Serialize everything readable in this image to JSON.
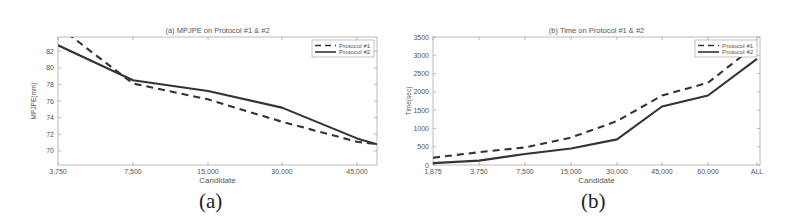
{
  "chart_data": [
    {
      "type": "line",
      "panel_caption": "(a)",
      "title": "(a) MPJPE on Protocol #1 & #2",
      "xlabel": "Candidate",
      "ylabel": "MPJPE(mm)",
      "categories": [
        "3,750",
        "7,500",
        "15,000",
        "30,000",
        "45,000"
      ],
      "x_tick_labels": [
        "3,750",
        "7,500",
        "15,000",
        "30,000",
        "45,000"
      ],
      "y_tick_labels": [
        "70",
        "72",
        "74",
        "76",
        "78",
        "80",
        "82"
      ],
      "ylim": [
        68.3,
        83.7
      ],
      "grid": false,
      "legend_position": "upper right",
      "series": [
        {
          "name": "Protocol #1",
          "style": "dashed",
          "values": [
            85.0,
            78.1,
            76.2,
            73.5,
            71.1
          ],
          "end_value": 70.8
        },
        {
          "name": "Protocol #2",
          "style": "solid",
          "values": [
            82.7,
            78.5,
            77.2,
            75.2,
            71.5
          ],
          "end_value": 70.8
        }
      ]
    },
    {
      "type": "line",
      "panel_caption": "(b)",
      "title": "(b) Time on Protocol #1 & #2",
      "xlabel": "Candidate",
      "ylabel": "Time(sec)",
      "categories": [
        "1,875",
        "3,750",
        "7,500",
        "15,000",
        "30,000",
        "45,000",
        "60,000",
        "ALL"
      ],
      "x_tick_labels": [
        "1,875",
        "3,750",
        "7,500",
        "15,000",
        "30,000",
        "45,000",
        "60,000",
        "ALL"
      ],
      "y_tick_labels": [
        "0",
        "500",
        "1000",
        "1500",
        "2000",
        "2500",
        "3000",
        "3500"
      ],
      "ylim": [
        0,
        3500
      ],
      "grid": false,
      "legend_position": "upper right",
      "series": [
        {
          "name": "Protocol #1",
          "style": "dashed",
          "values": [
            200,
            350,
            480,
            750,
            1200,
            1900,
            2250,
            3300
          ]
        },
        {
          "name": "Protocol #2",
          "style": "solid",
          "values": [
            50,
            120,
            300,
            450,
            700,
            1600,
            1900,
            2900
          ]
        }
      ]
    }
  ],
  "captions": {
    "a": "(a)",
    "b": "(b)"
  }
}
